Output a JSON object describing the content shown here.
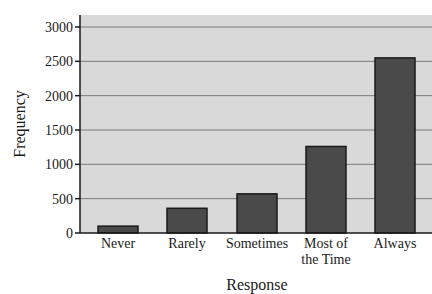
{
  "chart_data": {
    "type": "bar",
    "title": "",
    "xlabel": "Response",
    "ylabel": "Frequency",
    "categories": [
      "Never",
      "Rarely",
      "Sometimes",
      "Most of the Time",
      "Always"
    ],
    "category_label_lines": [
      [
        "Never"
      ],
      [
        "Rarely"
      ],
      [
        "Sometimes"
      ],
      [
        "Most of",
        "the Time"
      ],
      [
        "Always"
      ]
    ],
    "values": [
      100,
      360,
      570,
      1260,
      2550
    ],
    "ylim": [
      0,
      3000
    ],
    "yticks": [
      0,
      500,
      1000,
      1500,
      2000,
      2500,
      3000
    ],
    "grid": true,
    "legend": null
  },
  "colors": {
    "plot_background": "#d9d9d9",
    "bar_fill": "#4a4a4a",
    "bar_stroke": "#1a1a1a",
    "gridline": "#7a7a7a",
    "axis": "#1a1a1a"
  }
}
